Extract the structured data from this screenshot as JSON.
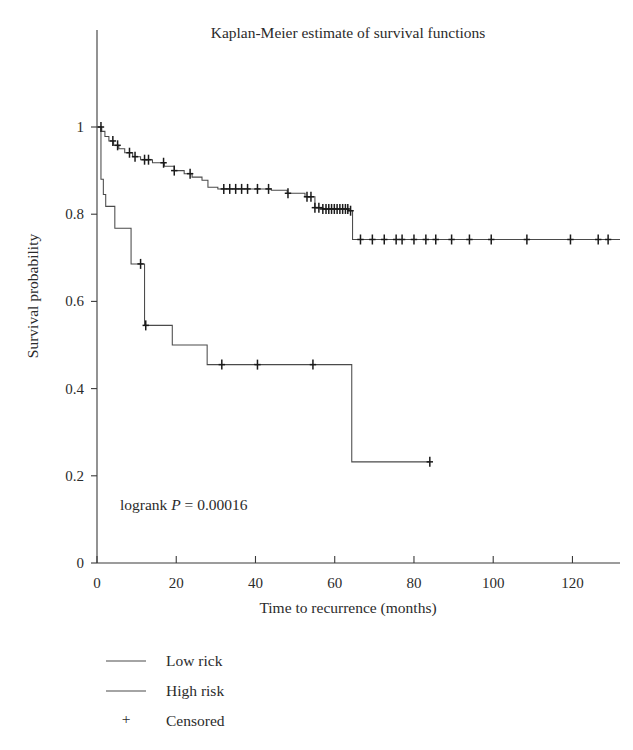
{
  "chart_data": {
    "type": "line",
    "title": "Kaplan-Meier estimate of survival functions",
    "xlabel": "Time to recurrence (months)",
    "ylabel": "Survival probability",
    "xlim": [
      0,
      132
    ],
    "ylim": [
      0,
      1.04
    ],
    "xticks": [
      0,
      20,
      40,
      60,
      80,
      100,
      120
    ],
    "xtick_labels": [
      "0",
      "20",
      "40",
      "60",
      "80",
      "100",
      "120"
    ],
    "yticks": [
      0,
      0.2,
      0.4,
      0.6,
      0.8,
      1
    ],
    "ytick_labels": [
      "0",
      "0.2",
      "0.4",
      "0.6",
      "0.8",
      "1"
    ],
    "grid": false,
    "legend_position": "below-plot",
    "annotations": [
      {
        "name": "logrank-p-value",
        "text_prefix": "logrank ",
        "text_italic": "P",
        "text_suffix": " = 0.00016",
        "full_text": "logrank P = 0.00016",
        "x": 6,
        "y": 0.135
      }
    ],
    "series": [
      {
        "name": "Low rick",
        "legend_label": "Low rick",
        "color": "#4a4a4a",
        "step_points": [
          [
            0,
            1.0
          ],
          [
            1.2,
            0.99
          ],
          [
            2.0,
            0.978
          ],
          [
            3.0,
            0.968
          ],
          [
            4.2,
            0.958
          ],
          [
            5.5,
            0.95
          ],
          [
            7.0,
            0.941
          ],
          [
            9.0,
            0.932
          ],
          [
            11.0,
            0.925
          ],
          [
            14.0,
            0.918
          ],
          [
            17.0,
            0.91
          ],
          [
            19.5,
            0.9
          ],
          [
            22.0,
            0.893
          ],
          [
            24.0,
            0.885
          ],
          [
            26.5,
            0.878
          ],
          [
            28.0,
            0.862
          ],
          [
            30.5,
            0.858
          ],
          [
            44.0,
            0.855
          ],
          [
            48.0,
            0.848
          ],
          [
            52.5,
            0.84
          ],
          [
            55.0,
            0.815
          ],
          [
            57.0,
            0.812
          ],
          [
            63.5,
            0.808
          ],
          [
            64.5,
            0.742
          ],
          [
            132,
            0.742
          ]
        ],
        "censored": [
          1.0,
          4.0,
          5.2,
          8.2,
          9.6,
          12.0,
          13.0,
          16.8,
          19.5,
          23.5,
          32.0,
          33.5,
          35.0,
          36.5,
          38.0,
          40.5,
          43.3,
          48.2,
          53.0,
          54.0,
          55.0,
          56.0,
          57.0,
          57.8,
          58.5,
          59.2,
          59.9,
          60.6,
          61.3,
          62.0,
          62.7,
          63.3,
          64.0,
          66.5,
          69.5,
          72.5,
          75.5,
          77.0,
          80.0,
          83.0,
          85.5,
          89.5,
          94.0,
          99.5,
          108.5,
          119.5,
          126.5,
          129.0
        ]
      },
      {
        "name": "High risk",
        "legend_label": "High risk",
        "color": "#4a4a4a",
        "step_points": [
          [
            0,
            1.0
          ],
          [
            1.0,
            0.88
          ],
          [
            1.6,
            0.845
          ],
          [
            2.2,
            0.818
          ],
          [
            4.5,
            0.768
          ],
          [
            8.6,
            0.686
          ],
          [
            12.0,
            0.545
          ],
          [
            19.0,
            0.5
          ],
          [
            27.8,
            0.455
          ],
          [
            64.3,
            0.232
          ],
          [
            84.0,
            0.232
          ]
        ],
        "censored": [
          11.0,
          12.3,
          31.5,
          40.5,
          54.5,
          84.0
        ]
      }
    ],
    "censored_marker": {
      "symbol": "+",
      "legend_label": "Censored"
    },
    "legend_entries": [
      {
        "label": "Low rick",
        "marker": "line"
      },
      {
        "label": "High risk",
        "marker": "line"
      },
      {
        "label": "Censored",
        "marker": "plus"
      }
    ]
  }
}
